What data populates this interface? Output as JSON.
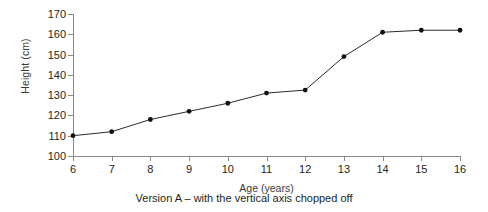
{
  "chart_data": {
    "type": "line",
    "title": "",
    "subtitle": "",
    "xlabel": "Age (years)",
    "ylabel": "Height (cm)",
    "x": [
      6,
      7,
      8,
      9,
      10,
      11,
      12,
      13,
      14,
      15,
      16
    ],
    "values": [
      110,
      112,
      118,
      122,
      126,
      131,
      132.5,
      149,
      161,
      162,
      162
    ],
    "xticklabels": [
      "6",
      "7",
      "8",
      "9",
      "10",
      "11",
      "12",
      "13",
      "14",
      "15",
      "16"
    ],
    "yticklabels": [
      "100",
      "110",
      "120",
      "130",
      "140",
      "150",
      "160",
      "170"
    ],
    "yticks": [
      100,
      110,
      120,
      130,
      140,
      150,
      160,
      170
    ],
    "xlim": [
      6,
      16
    ],
    "ylim": [
      100,
      170
    ],
    "grid": false,
    "legend": false,
    "marker": "filled-circle",
    "line_color": "#2b2b2b",
    "marker_color": "#111111",
    "axis_color": "#8a8a8a",
    "background": "#ffffff"
  },
  "caption": "Version A – with the vertical axis chopped off",
  "axis_titles": {
    "y": "Height (cm)",
    "x": "Age (years)"
  }
}
